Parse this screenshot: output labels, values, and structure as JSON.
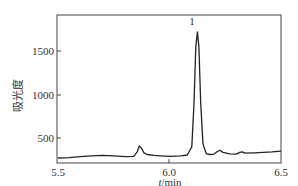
{
  "chart_data": {
    "type": "line",
    "title": "",
    "xlabel": "t/min",
    "ylabel": "吸光度",
    "xlim": [
      5.5,
      6.5
    ],
    "ylim": [
      250,
      1800
    ],
    "x_ticks": [
      5.5,
      6.0,
      6.5
    ],
    "x_tick_labels": [
      "5.5",
      "6.0",
      "6.5"
    ],
    "y_ticks": [
      500,
      1000,
      1500
    ],
    "y_tick_labels": [
      "500",
      "1000",
      "1500"
    ],
    "grid": false,
    "legend": null,
    "annotations": [
      {
        "text": "1",
        "x": 6.12,
        "y": 1720
      }
    ],
    "series": [
      {
        "name": "chromatogram",
        "x": [
          5.5,
          5.55,
          5.6,
          5.65,
          5.7,
          5.75,
          5.8,
          5.84,
          5.855,
          5.865,
          5.875,
          5.885,
          5.9,
          5.93,
          5.96,
          6.0,
          6.05,
          6.08,
          6.1,
          6.11,
          6.118,
          6.125,
          6.132,
          6.14,
          6.15,
          6.165,
          6.18,
          6.2,
          6.215,
          6.225,
          6.24,
          6.27,
          6.3,
          6.315,
          6.325,
          6.34,
          6.38,
          6.42,
          6.46,
          6.5
        ],
        "y": [
          270,
          275,
          285,
          295,
          300,
          295,
          285,
          290,
          340,
          410,
          380,
          330,
          310,
          300,
          295,
          290,
          295,
          305,
          400,
          900,
          1550,
          1720,
          1550,
          900,
          430,
          320,
          310,
          315,
          345,
          360,
          335,
          318,
          315,
          335,
          340,
          325,
          330,
          335,
          340,
          350
        ]
      }
    ]
  },
  "peak_label": "1",
  "axis": {
    "x_label": "t/min",
    "y_label": "吸光度",
    "x_ticks": [
      "5.5",
      "6.0",
      "6.5"
    ],
    "y_ticks": [
      "500",
      "1000",
      "1500"
    ]
  }
}
